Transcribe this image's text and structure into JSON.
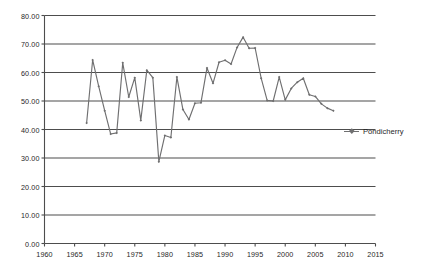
{
  "chart_data": {
    "type": "line",
    "title": "",
    "xlabel": "",
    "ylabel": "",
    "xlim": [
      1960,
      2015
    ],
    "ylim": [
      0,
      80
    ],
    "grid": true,
    "grid_axis": "y",
    "legend_position": "right",
    "series": [
      {
        "name": "Pondicherry",
        "color": "#6f6f70",
        "marker": "diamond",
        "x": [
          1967,
          1968,
          1969,
          1970,
          1971,
          1972,
          1973,
          1974,
          1975,
          1976,
          1977,
          1978,
          1979,
          1980,
          1981,
          1982,
          1983,
          1984,
          1985,
          1986,
          1987,
          1988,
          1989,
          1990,
          1991,
          1992,
          1993,
          1994,
          1995,
          1996,
          1997,
          1998,
          1999,
          2000,
          2001,
          2002,
          2003,
          2004,
          2005,
          2006,
          2007,
          2008
        ],
        "values": [
          42.3,
          64.4,
          55.2,
          46.6,
          38.4,
          38.8,
          63.4,
          51.4,
          58.2,
          43.2,
          60.8,
          58.2,
          28.7,
          37.9,
          37.2,
          58.4,
          47.0,
          43.5,
          49.2,
          49.4,
          61.6,
          56.2,
          63.6,
          64.3,
          63.0,
          68.8,
          72.4,
          68.5,
          68.6,
          58.0,
          50.2,
          50.0,
          58.4,
          50.4,
          54.4,
          56.6,
          58.0,
          52.2,
          51.6,
          49.0,
          47.5,
          46.6
        ]
      }
    ],
    "x_ticks": [
      1960,
      1965,
      1970,
      1975,
      1980,
      1985,
      1990,
      1995,
      2000,
      2005,
      2010,
      2015
    ],
    "x_tick_labels": [
      "1960",
      "1965",
      "1970",
      "1975",
      "1980",
      "1985",
      "1990",
      "1995",
      "2000",
      "2005",
      "2010",
      "2015"
    ],
    "y_ticks": [
      0,
      10,
      20,
      30,
      40,
      50,
      60,
      70,
      80
    ],
    "y_tick_labels": [
      "0.00",
      "10.00",
      "20.00",
      "30.00",
      "40.00",
      "50.00",
      "60.00",
      "70.00",
      "80.00"
    ]
  },
  "legend": {
    "entries": [
      {
        "label": "Pondicherry"
      }
    ]
  },
  "colors": {
    "series": "#6f6f70",
    "grid": "#4d4d4d",
    "axis": "#4d4d4d",
    "text": "#1f1f1f",
    "background": "#ffffff"
  }
}
